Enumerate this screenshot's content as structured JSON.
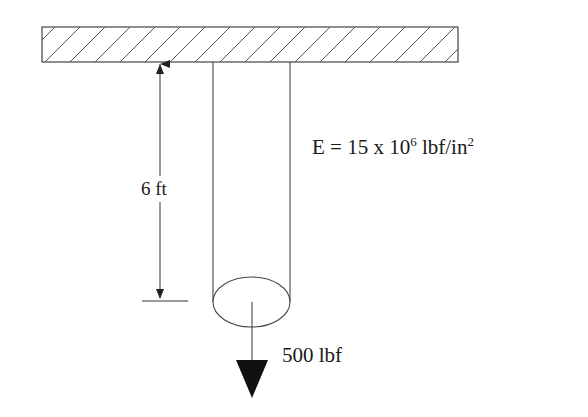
{
  "diagram": {
    "support": {
      "type": "fixed-wall-hatched"
    },
    "dimension": {
      "label": "6 ft"
    },
    "material": {
      "prefix": "E = 15 x 10",
      "exponent": "6",
      "unit": " lbf/in",
      "unit_exp": "2"
    },
    "load": {
      "label": "500 lbf",
      "direction": "down"
    }
  },
  "colors": {
    "line": "#333333",
    "fill_arrow": "#111111",
    "background": "#ffffff"
  }
}
